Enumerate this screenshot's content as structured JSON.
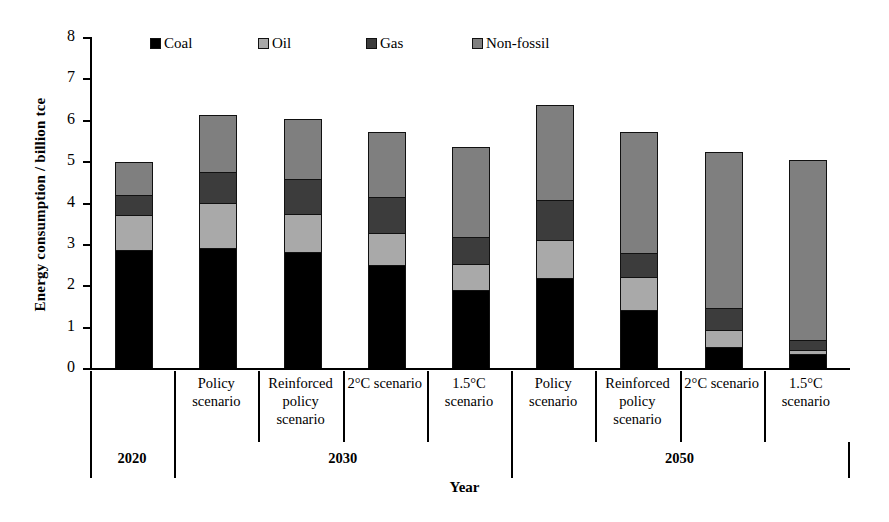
{
  "chart_data": {
    "type": "bar",
    "stacked": true,
    "title": "",
    "xlabel": "Year",
    "ylabel": "Energy consumption / billion tce",
    "ylim": [
      0,
      8
    ],
    "ytick_labels": [
      "8",
      "7",
      "6",
      "5",
      "4",
      "3",
      "2",
      "1",
      "0"
    ],
    "ytick_values": [
      8,
      7,
      6,
      5,
      4,
      3,
      2,
      1,
      0
    ],
    "grid": false,
    "legend_position": "top-inside",
    "categories": [
      "",
      "Policy scenario",
      "Reinforced policy scenario",
      "2°C scenario",
      "1.5°C scenario",
      "Policy scenario",
      "Reinforced policy scenario",
      "2°C scenario",
      "1.5°C scenario"
    ],
    "group_labels": [
      "2020",
      "2030",
      "2050"
    ],
    "group_spans": [
      1,
      4,
      4
    ],
    "series": [
      {
        "name": "Coal",
        "color": "#000000",
        "values": [
          2.85,
          2.9,
          2.8,
          2.49,
          1.88,
          2.17,
          1.4,
          0.51,
          0.34
        ]
      },
      {
        "name": "Oil",
        "color": "#a9a9a9",
        "values": [
          0.85,
          1.08,
          0.92,
          0.77,
          0.64,
          0.92,
          0.8,
          0.41,
          0.09
        ]
      },
      {
        "name": "Gas",
        "color": "#3c3c3c",
        "values": [
          0.48,
          0.75,
          0.86,
          0.87,
          0.65,
          0.97,
          0.58,
          0.53,
          0.25
        ]
      },
      {
        "name": "Non-fossil",
        "color": "#7f7f7f",
        "values": [
          0.79,
          1.38,
          1.45,
          1.57,
          2.16,
          2.29,
          2.92,
          3.77,
          4.34
        ]
      }
    ],
    "totals": [
      4.97,
      6.11,
      6.03,
      5.7,
      5.33,
      6.35,
      5.7,
      5.22,
      5.02
    ]
  },
  "legend": {
    "items": [
      {
        "label": "Coal",
        "color": "#000000"
      },
      {
        "label": "Oil",
        "color": "#a9a9a9"
      },
      {
        "label": "Gas",
        "color": "#3c3c3c"
      },
      {
        "label": "Non-fossil",
        "color": "#7f7f7f"
      }
    ]
  },
  "axes": {
    "y_title": "Energy consumption / billion tce",
    "x_title": "Year",
    "y_ticks": [
      "8",
      "7",
      "6",
      "5",
      "4",
      "3",
      "2",
      "1",
      "0"
    ]
  },
  "scenario_labels": [
    "",
    "Policy scenario",
    "Reinforced policy scenario",
    "2°C scenario",
    "1.5°C scenario",
    "Policy scenario",
    "Reinforced policy scenario",
    "2°C scenario",
    "1.5°C scenario"
  ],
  "years": [
    "2020",
    "2030",
    "2050"
  ]
}
